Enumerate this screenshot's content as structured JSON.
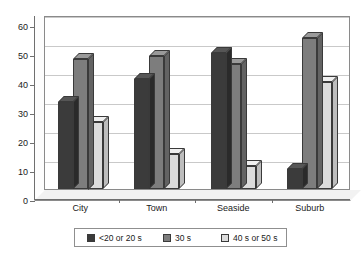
{
  "chart_data": {
    "type": "bar",
    "title": "",
    "xlabel": "",
    "ylabel": "",
    "categories": [
      "City",
      "Town",
      "Seaside",
      "Suburb"
    ],
    "series": [
      {
        "name": "<20 or 20 s",
        "color": "#3b3b3b",
        "values": [
          30,
          38,
          47,
          7
        ]
      },
      {
        "name": "30 s",
        "color": "#7d7d7d",
        "values": [
          45,
          46,
          43,
          52
        ]
      },
      {
        "name": "40 s or 50 s",
        "color": "#dcdcdc",
        "values": [
          23,
          12,
          8,
          37
        ]
      }
    ],
    "ylim": [
      0,
      60
    ],
    "yticks": [
      0,
      10,
      20,
      30,
      40,
      50,
      60
    ],
    "ytick_labels": [
      "0",
      "10",
      "20",
      "30",
      "40",
      "50",
      "60"
    ],
    "grid": true,
    "legend_position": "bottom",
    "style": "3d-column"
  },
  "legend": {
    "items": [
      {
        "label": "<20 or 20 s"
      },
      {
        "label": "30 s"
      },
      {
        "label": "40 s or 50 s"
      }
    ]
  }
}
